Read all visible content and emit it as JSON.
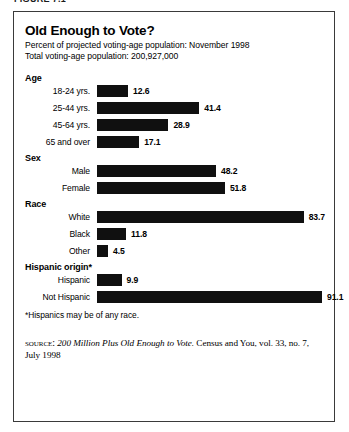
{
  "figure_caption": "FIGURE 7.1",
  "chart": {
    "title": "Old Enough to Vote?",
    "subtitle_1": "Percent of projected voting-age population: November 1998",
    "subtitle_2": "Total voting-age population: 200,927,000",
    "footnote": "*Hispanics may be of any race.",
    "source": {
      "label": "source:",
      "title": "200 Million Plus Old Enough to Vote.",
      "rest": " Census and You, vol. 33, no. 7, July 1998"
    }
  },
  "chart_data": {
    "type": "bar",
    "orientation": "horizontal",
    "title": "Old Enough to Vote?",
    "subtitle": "Percent of projected voting-age population: November 1998",
    "xlabel": "",
    "ylabel": "",
    "xlim": [
      0,
      91.1
    ],
    "grid": false,
    "legend": "none",
    "bar_color": "#101010",
    "groups": [
      {
        "name": "Age",
        "categories": [
          "18-24 yrs.",
          "25-44 yrs.",
          "45-64 yrs.",
          "65 and over"
        ],
        "values": [
          12.6,
          41.4,
          28.9,
          17.1
        ],
        "value_labels": [
          "12.6",
          "41.4",
          "28.9",
          "17.1"
        ]
      },
      {
        "name": "Sex",
        "categories": [
          "Male",
          "Female"
        ],
        "values": [
          48.2,
          51.8
        ],
        "value_labels": [
          "48.2",
          "51.8"
        ]
      },
      {
        "name": "Race",
        "categories": [
          "White",
          "Black",
          "Other"
        ],
        "values": [
          83.7,
          11.8,
          4.5
        ],
        "value_labels": [
          "83.7",
          "11.8",
          "4.5"
        ]
      },
      {
        "name": "Hispanic origin*",
        "categories": [
          "Hispanic",
          "Not Hispanic"
        ],
        "values": [
          9.9,
          91.1
        ],
        "value_labels": [
          "9.9",
          "91.1"
        ]
      }
    ]
  }
}
